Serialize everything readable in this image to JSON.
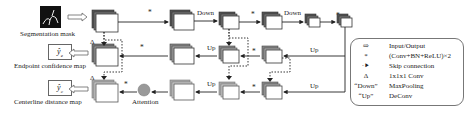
{
  "diagram": {
    "inputs": {
      "segmentation_mask_label": "Segmentation mask"
    },
    "outputs": [
      {
        "symbol": "ŷ",
        "subscript": "e",
        "label": "Endpoint confidence map"
      },
      {
        "symbol": "ŷ",
        "subscript": "c",
        "label": "Centerline distance map"
      }
    ],
    "attention_label": "Attention",
    "edge_labels": {
      "down": "Down",
      "up": "Up",
      "conv": "*",
      "one_by_one": "Δ"
    },
    "legend": {
      "items": [
        {
          "symbol_name": "hollow-arrow-icon",
          "symbol": "⇨",
          "text": "Input/Output"
        },
        {
          "symbol_name": "asterisk-icon",
          "symbol": "*",
          "text": "(Conv+BN+ReLU)×2"
        },
        {
          "symbol_name": "dotted-arrow-icon",
          "symbol": "·⯈",
          "text": "Skip connection"
        },
        {
          "symbol_name": "delta-icon",
          "symbol": "Δ",
          "text": "1x1x1 Conv"
        },
        {
          "symbol_name": "down-quote",
          "symbol": "“Down”",
          "text": "MaxPooling"
        },
        {
          "symbol_name": "up-quote",
          "symbol": "“Up”",
          "text": "DeConv"
        }
      ]
    },
    "colors": {
      "line": "#222222",
      "block_front": "#ffffff",
      "block_back_dark": "#555555",
      "block_back_light": "#aaaaaa",
      "attention": "#999999",
      "mask": "#111111"
    }
  }
}
